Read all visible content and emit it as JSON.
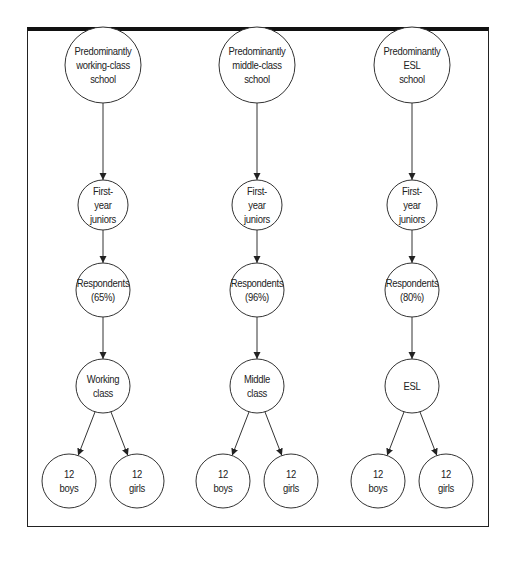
{
  "diagram": {
    "type": "flow-tree",
    "columns": [
      {
        "id": "working-class",
        "nodes": {
          "school": "Predominantly\nworking-class\nschool",
          "juniors": "First-\nyear\njuniors",
          "respondents": "Respondents\n(65%)",
          "group": "Working\nclass",
          "boys": "12\nboys",
          "girls": "12\ngirls"
        }
      },
      {
        "id": "middle-class",
        "nodes": {
          "school": "Predominantly\nmiddle-class\nschool",
          "juniors": "First-\nyear\njuniors",
          "respondents": "Respondents\n(96%)",
          "group": "Middle\nclass",
          "boys": "12\nboys",
          "girls": "12\ngirls"
        }
      },
      {
        "id": "esl",
        "nodes": {
          "school": "Predominantly\nESL\nschool",
          "juniors": "First-\nyear\njuniors",
          "respondents": "Respondents\n(80%)",
          "group": "ESL",
          "boys": "12\nboys",
          "girls": "12\ngirls"
        }
      }
    ],
    "colors": {
      "stroke": "#222222",
      "background": "#ffffff",
      "text": "#222222"
    }
  }
}
